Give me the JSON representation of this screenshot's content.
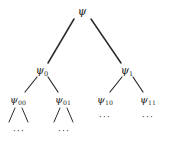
{
  "figure": {
    "type": "binary-tree-diagram",
    "width": 169,
    "height": 143,
    "background_color": "#ffffff",
    "line_color": "#2b2b2b",
    "text_color": "#1b1b1b"
  },
  "nodes": {
    "root": {
      "symbol": "ψ",
      "subscript": "",
      "x": 82,
      "y": 11,
      "level": 0
    },
    "n0": {
      "symbol": "ψ",
      "subscript": "0",
      "x": 42,
      "y": 70,
      "level": 1
    },
    "n1": {
      "symbol": "ψ",
      "subscript": "1",
      "x": 127,
      "y": 70,
      "level": 1
    },
    "n00": {
      "symbol": "ψ",
      "subscript": "00",
      "x": 18,
      "y": 100,
      "level": 2
    },
    "n01": {
      "symbol": "ψ",
      "subscript": "01",
      "x": 63,
      "y": 100,
      "level": 2
    },
    "n10": {
      "symbol": "ψ",
      "subscript": "10",
      "x": 105,
      "y": 100,
      "level": 2
    },
    "n11": {
      "symbol": "ψ",
      "subscript": "11",
      "x": 148,
      "y": 100,
      "level": 2
    }
  },
  "edges": [
    {
      "name": "root-to-psi0",
      "x1": 74,
      "y1": 19,
      "x2": 48,
      "y2": 63
    },
    {
      "name": "root-to-psi1",
      "x1": 91,
      "y1": 19,
      "x2": 121,
      "y2": 63
    },
    {
      "name": "psi0-to-psi00",
      "x1": 37,
      "y1": 77,
      "x2": 25,
      "y2": 92
    },
    {
      "name": "psi0-to-psi01",
      "x1": 48,
      "y1": 77,
      "x2": 58,
      "y2": 92
    },
    {
      "name": "psi1-to-psi10",
      "x1": 122,
      "y1": 77,
      "x2": 110,
      "y2": 92
    },
    {
      "name": "psi1-to-psi11",
      "x1": 133,
      "y1": 77,
      "x2": 143,
      "y2": 92
    },
    {
      "name": "psi00-stub-left",
      "x1": 15,
      "y1": 108,
      "x2": 9,
      "y2": 122
    },
    {
      "name": "psi00-stub-right",
      "x1": 22,
      "y1": 108,
      "x2": 28,
      "y2": 122
    },
    {
      "name": "psi01-stub-left",
      "x1": 60,
      "y1": 108,
      "x2": 54,
      "y2": 122
    },
    {
      "name": "psi01-stub-right",
      "x1": 67,
      "y1": 108,
      "x2": 73,
      "y2": 122
    }
  ],
  "ellipses": [
    {
      "name": "ellipsis-under-psi00",
      "text": "···",
      "x": 19,
      "y": 131
    },
    {
      "name": "ellipsis-under-psi01",
      "text": "···",
      "x": 64,
      "y": 131
    },
    {
      "name": "ellipsis-under-psi10",
      "text": "···",
      "x": 105,
      "y": 117
    },
    {
      "name": "ellipsis-under-psi11",
      "text": "···",
      "x": 148,
      "y": 117
    }
  ]
}
